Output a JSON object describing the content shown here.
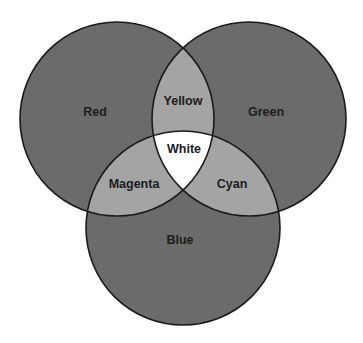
{
  "diagram": {
    "type": "venn-3-circle",
    "colors": {
      "background": "#ffffff",
      "primary_fill": "#6b6b6b",
      "secondary_fill": "#a4a4a4",
      "center_fill": "#ffffff",
      "stroke": "#1a1a1a"
    },
    "circles": [
      {
        "id": "red",
        "label": "Red",
        "cx": 117,
        "cy": 119,
        "r": 97,
        "label_x": 95,
        "label_y": 112
      },
      {
        "id": "green",
        "label": "Green",
        "cx": 249,
        "cy": 119,
        "r": 97,
        "label_x": 266,
        "label_y": 112
      },
      {
        "id": "blue",
        "label": "Blue",
        "cx": 183,
        "cy": 228,
        "r": 97,
        "label_x": 180,
        "label_y": 240
      }
    ],
    "overlaps": [
      {
        "id": "yellow",
        "label": "Yellow",
        "sets": [
          "red",
          "green"
        ],
        "label_x": 183,
        "label_y": 101
      },
      {
        "id": "magenta",
        "label": "Magenta",
        "sets": [
          "red",
          "blue"
        ],
        "label_x": 134,
        "label_y": 184
      },
      {
        "id": "cyan",
        "label": "Cyan",
        "sets": [
          "green",
          "blue"
        ],
        "label_x": 232,
        "label_y": 184
      },
      {
        "id": "white",
        "label": "White",
        "sets": [
          "red",
          "green",
          "blue"
        ],
        "label_x": 184,
        "label_y": 149
      }
    ]
  }
}
